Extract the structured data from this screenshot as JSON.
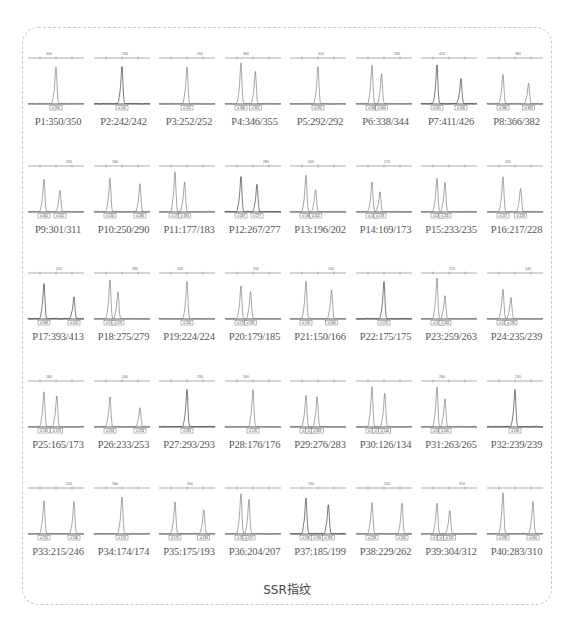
{
  "caption": "SSR指纹",
  "chart_data": {
    "type": "electropherogram-grid",
    "title": "SSR指纹",
    "rows": 5,
    "columns": 8,
    "panels": [
      {
        "label": "P1:350/350",
        "primer": "P1",
        "alleles": [
          350,
          350
        ],
        "axis_tick": "340",
        "bin_labels": [
          "350"
        ]
      },
      {
        "label": "P2:242/242",
        "primer": "P2",
        "alleles": [
          242,
          242
        ],
        "axis_tick": "250",
        "bin_labels": [
          "242"
        ]
      },
      {
        "label": "P3:252/252",
        "primer": "P3",
        "alleles": [
          252,
          252
        ],
        "axis_tick": "260",
        "bin_labels": [
          "252"
        ]
      },
      {
        "label": "P4:346/355",
        "primer": "P4",
        "alleles": [
          346,
          355
        ],
        "axis_tick": "360",
        "bin_labels": [
          "346",
          "355"
        ]
      },
      {
        "label": "P5:292/292",
        "primer": "P5",
        "alleles": [
          292,
          292
        ],
        "axis_tick": "310",
        "bin_labels": [
          "292"
        ]
      },
      {
        "label": "P6:338/344",
        "primer": "P6",
        "alleles": [
          338,
          344
        ],
        "axis_tick": "330",
        "bin_labels": [
          "338",
          "344"
        ]
      },
      {
        "label": "P7:411/426",
        "primer": "P7",
        "alleles": [
          411,
          426
        ],
        "axis_tick": "420",
        "bin_labels": [
          "411",
          "426"
        ]
      },
      {
        "label": "P8:366/382",
        "primer": "P8",
        "alleles": [
          366,
          382
        ],
        "axis_tick": "380",
        "bin_labels": [
          "366",
          "382"
        ]
      },
      {
        "label": "P9:301/311",
        "primer": "P9",
        "alleles": [
          301,
          311
        ],
        "axis_tick": "290",
        "bin_labels": [
          "301",
          "311"
        ]
      },
      {
        "label": "P10:250/290",
        "primer": "P10",
        "alleles": [
          250,
          290
        ],
        "axis_tick": "260",
        "bin_labels": [
          "250",
          "290"
        ]
      },
      {
        "label": "P11:177/183",
        "primer": "P11",
        "alleles": [
          177,
          183
        ],
        "axis_tick": "",
        "bin_labels": [
          "177",
          "183"
        ]
      },
      {
        "label": "P12:267/277",
        "primer": "P12",
        "alleles": [
          267,
          277
        ],
        "axis_tick": "280",
        "bin_labels": [
          "267",
          "277"
        ]
      },
      {
        "label": "P13:196/202",
        "primer": "P13",
        "alleles": [
          196,
          202
        ],
        "axis_tick": "200",
        "bin_labels": [
          "196",
          "202"
        ]
      },
      {
        "label": "P14:169/173",
        "primer": "P14",
        "alleles": [
          169,
          173
        ],
        "axis_tick": "170",
        "bin_labels": [
          "169",
          "173"
        ]
      },
      {
        "label": "P15:233/235",
        "primer": "P15",
        "alleles": [
          233,
          235
        ],
        "axis_tick": "",
        "bin_labels": [
          "233",
          "235"
        ]
      },
      {
        "label": "P16:217/228",
        "primer": "P16",
        "alleles": [
          217,
          228
        ],
        "axis_tick": "220",
        "bin_labels": [
          "217",
          "228"
        ]
      },
      {
        "label": "P17:393/413",
        "primer": "P17",
        "alleles": [
          393,
          413
        ],
        "axis_tick": "410",
        "bin_labels": [
          "393",
          "413"
        ]
      },
      {
        "label": "P18:275/279",
        "primer": "P18",
        "alleles": [
          275,
          279
        ],
        "axis_tick": "280",
        "bin_labels": [
          "275",
          "279"
        ]
      },
      {
        "label": "P19:224/224",
        "primer": "P19",
        "alleles": [
          224,
          224
        ],
        "axis_tick": "240",
        "bin_labels": [
          "224"
        ]
      },
      {
        "label": "P20:179/185",
        "primer": "P20",
        "alleles": [
          179,
          185
        ],
        "axis_tick": "200",
        "bin_labels": [
          "179",
          "185"
        ]
      },
      {
        "label": "P21:150/166",
        "primer": "P21",
        "alleles": [
          150,
          166
        ],
        "axis_tick": "160",
        "bin_labels": [
          "150",
          "166"
        ]
      },
      {
        "label": "P22:175/175",
        "primer": "P22",
        "alleles": [
          175,
          175
        ],
        "axis_tick": "",
        "bin_labels": [
          "175"
        ]
      },
      {
        "label": "P23:259/263",
        "primer": "P23",
        "alleles": [
          259,
          263
        ],
        "axis_tick": "270",
        "bin_labels": [
          "259",
          "263"
        ]
      },
      {
        "label": "P24:235/239",
        "primer": "P24",
        "alleles": [
          235,
          239
        ],
        "axis_tick": "240",
        "bin_labels": [
          "235",
          "239"
        ]
      },
      {
        "label": "P25:165/173",
        "primer": "P25",
        "alleles": [
          165,
          173
        ],
        "axis_tick": "160",
        "bin_labels": [
          "165",
          "173"
        ]
      },
      {
        "label": "P26:233/253",
        "primer": "P26",
        "alleles": [
          233,
          253
        ],
        "axis_tick": "240",
        "bin_labels": [
          "233",
          "253"
        ]
      },
      {
        "label": "P27:293/293",
        "primer": "P27",
        "alleles": [
          293,
          293
        ],
        "axis_tick": "290",
        "bin_labels": [
          "293"
        ]
      },
      {
        "label": "P28:176/176",
        "primer": "P28",
        "alleles": [
          176,
          176
        ],
        "axis_tick": "160",
        "bin_labels": [
          "176"
        ]
      },
      {
        "label": "P29:276/283",
        "primer": "P29",
        "alleles": [
          276,
          283
        ],
        "axis_tick": "",
        "bin_labels": [
          "276",
          "279",
          "283"
        ]
      },
      {
        "label": "P30:126/134",
        "primer": "P30",
        "alleles": [
          126,
          134
        ],
        "axis_tick": "",
        "bin_labels": [
          "126",
          "134",
          "144"
        ]
      },
      {
        "label": "P31:263/265",
        "primer": "P31",
        "alleles": [
          263,
          265
        ],
        "axis_tick": "260",
        "bin_labels": [
          "263",
          "265"
        ]
      },
      {
        "label": "P32:239/239",
        "primer": "P32",
        "alleles": [
          239,
          239
        ],
        "axis_tick": "230",
        "bin_labels": [
          "239"
        ]
      },
      {
        "label": "P33:215/246",
        "primer": "P33",
        "alleles": [
          215,
          246
        ],
        "axis_tick": "220",
        "bin_labels": [
          "215",
          "246"
        ]
      },
      {
        "label": "P34:174/174",
        "primer": "P34",
        "alleles": [
          174,
          174
        ],
        "axis_tick": "160",
        "bin_labels": [
          "174"
        ]
      },
      {
        "label": "P35:175/193",
        "primer": "P35",
        "alleles": [
          175,
          193
        ],
        "axis_tick": "200",
        "bin_labels": [
          "175",
          "193"
        ]
      },
      {
        "label": "P36:204/207",
        "primer": "P36",
        "alleles": [
          204,
          207
        ],
        "axis_tick": "",
        "bin_labels": [
          "204",
          "207"
        ]
      },
      {
        "label": "P37:185/199",
        "primer": "P37",
        "alleles": [
          185,
          199
        ],
        "axis_tick": "190",
        "bin_labels": [
          "185",
          "195",
          "199"
        ]
      },
      {
        "label": "P38:229/262",
        "primer": "P38",
        "alleles": [
          229,
          262
        ],
        "axis_tick": "250",
        "bin_labels": [
          "229",
          "262"
        ]
      },
      {
        "label": "P39:304/312",
        "primer": "P39",
        "alleles": [
          304,
          312
        ],
        "axis_tick": "310",
        "bin_labels": [
          "304",
          "308",
          "312"
        ]
      },
      {
        "label": "P40:283/310",
        "primer": "P40",
        "alleles": [
          283,
          310
        ],
        "axis_tick": "",
        "bin_labels": [
          "283",
          "310"
        ]
      }
    ]
  }
}
